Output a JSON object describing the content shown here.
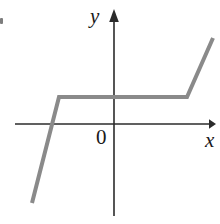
{
  "figure": {
    "width": 220,
    "height": 224,
    "background": "#ffffff"
  },
  "labels": {
    "y_axis": "y",
    "x_axis": "x",
    "origin": "0"
  },
  "colors": {
    "axis": "#2b2b2b",
    "curve": "#8a8a8a",
    "text": "#1a1a1a",
    "background": "#ffffff"
  },
  "chart_data": {
    "type": "line",
    "title": "",
    "subtitle": "",
    "xlabel": "x",
    "ylabel": "y",
    "legend": [],
    "grid": false,
    "axes": {
      "origin_label": "0",
      "x_axis_pixel_y": 124,
      "y_axis_pixel_x": 114,
      "x_axis_arrow": "right",
      "y_axis_arrow": "up",
      "x_axis_pixel_range": [
        15,
        215
      ],
      "y_axis_pixel_range": [
        10,
        215
      ],
      "tick_labels_x": [],
      "tick_labels_y": []
    },
    "series": [
      {
        "name": "piecewise-curve",
        "color": "#8a8a8a",
        "width": 4,
        "description": "Piecewise linear: steep rising segment, flat plateau above the x-axis, then steep rising segment",
        "points_pixel": [
          [
            32,
            203
          ],
          [
            59,
            97
          ],
          [
            187,
            97
          ],
          [
            213,
            38
          ]
        ],
        "points_data": [
          [
            -2.4,
            -2.0
          ],
          [
            -1.9,
            0.55
          ],
          [
            1.5,
            0.55
          ],
          [
            2.2,
            2.1
          ]
        ]
      }
    ],
    "annotations": [
      {
        "text": "x-intercept",
        "pixel": [
          52,
          124
        ],
        "visible": false
      }
    ]
  }
}
